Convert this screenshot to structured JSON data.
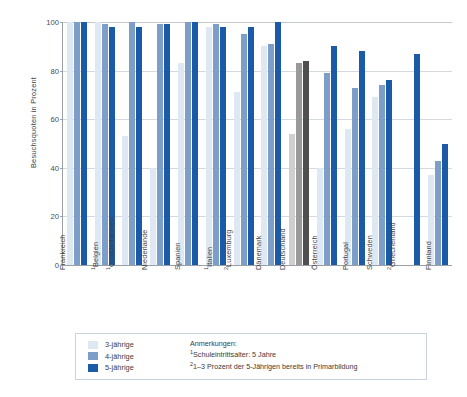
{
  "axis": {
    "y_title": "Besuchsquoten in Prozent",
    "y_ticks": [
      "0",
      "20",
      "40",
      "60",
      "80",
      "100"
    ]
  },
  "legend": {
    "items": [
      {
        "label": "3-jährige",
        "color": "#dde8f3"
      },
      {
        "label": "4-jährige",
        "color": "#7d9ec8"
      },
      {
        "label": "5-jährige",
        "color": "#1b5aa6"
      }
    ]
  },
  "notes": {
    "heading": "Anmerkungen:",
    "lines": [
      {
        "marker": "1",
        "text": "Schuleintrittsalter: 5 Jahre"
      },
      {
        "marker": "2",
        "text": "1–3 Prozent der 5-Jährigen bereits in Primarbildung"
      }
    ]
  },
  "chart_data": {
    "type": "bar",
    "title": "",
    "xlabel": "",
    "ylabel": "Besuchsquoten in Prozent",
    "ylim": [
      0,
      100
    ],
    "grid": true,
    "legend_position": "bottom-left",
    "categories": [
      "Frankreich",
      "Großbritannien",
      "Belgien",
      "Niederlande",
      "Spanien",
      "Italien",
      "Luxemburg",
      "Dänemark",
      "Deutschland",
      "Österreich",
      "Portugal",
      "Schweden",
      "Griechenland",
      "Finnland"
    ],
    "category_labels": [
      {
        "text": "Frankreich",
        "marker": ""
      },
      {
        "text": "Belgien",
        "marker": "1"
      },
      {
        "text": "Großbritannien",
        "marker": "1"
      },
      {
        "text": "Niederlande",
        "marker": ""
      },
      {
        "text": "Spanien",
        "marker": ""
      },
      {
        "text": "Italien",
        "marker": "1"
      },
      {
        "text": "Luxemburg",
        "marker": "2"
      },
      {
        "text": "Dänemark",
        "marker": ""
      },
      {
        "text": "Deutschland",
        "marker": ""
      },
      {
        "text": "Österreich",
        "marker": ""
      },
      {
        "text": "Portugal",
        "marker": ""
      },
      {
        "text": "Schweden",
        "marker": ""
      },
      {
        "text": "Griechenland",
        "marker": "2"
      },
      {
        "text": "Finnland",
        "marker": ""
      }
    ],
    "series": [
      {
        "name": "3-jährige",
        "color": "#dde8f3",
        "values": [
          100,
          100,
          53,
          40,
          83,
          98,
          71,
          90,
          54,
          40,
          56,
          69,
          0,
          37
        ]
      },
      {
        "name": "4-jährige",
        "color": "#7d9ec8",
        "values": [
          100,
          99,
          100,
          99,
          100,
          99,
          95,
          91,
          83,
          79,
          73,
          74,
          0,
          43
        ]
      },
      {
        "name": "5-jährige",
        "color": "#1b5aa6",
        "values": [
          100,
          98,
          98,
          99,
          100,
          98,
          98,
          100,
          84,
          90,
          88,
          76,
          87,
          50
        ]
      }
    ],
    "highlight_category": "Deutschland",
    "highlight_colors": {
      "3-jährige": "#cfcfcf",
      "4-jährige": "#9a9a9a",
      "5-jährige": "#4f4f4f"
    }
  }
}
